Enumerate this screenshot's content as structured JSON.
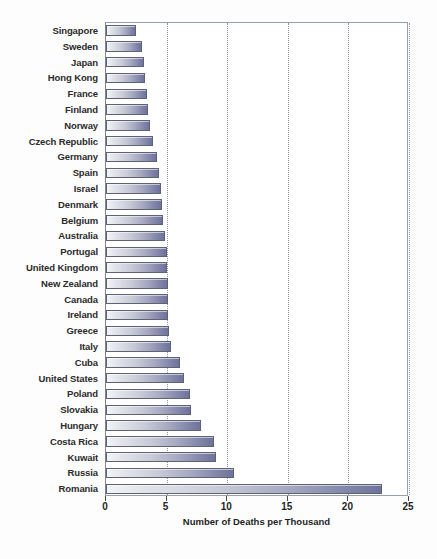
{
  "chart_data": {
    "type": "bar",
    "orientation": "horizontal",
    "title": "",
    "subtitle": "",
    "xlabel": "Number of Deaths per Thousand",
    "ylabel": "",
    "xlim": [
      0,
      25
    ],
    "xticks": [
      0,
      5,
      10,
      15,
      20,
      25
    ],
    "xtick_labels": [
      "0",
      "5",
      "10",
      "15",
      "20",
      "25"
    ],
    "grid": "vertical-dotted",
    "legend": "none",
    "series_name": "Number of Deaths per Thousand",
    "categories": [
      "Singapore",
      "Sweden",
      "Japan",
      "Hong Kong",
      "France",
      "Finland",
      "Norway",
      "Czech Republic",
      "Germany",
      "Spain",
      "Israel",
      "Denmark",
      "Belgium",
      "Australia",
      "Portugal",
      "United Kingdom",
      "New Zealand",
      "Canada",
      "Ireland",
      "Greece",
      "Italy",
      "Cuba",
      "United States",
      "Poland",
      "Slovakia",
      "Hungary",
      "Costa Rica",
      "Kuwait",
      "Russia",
      "Romania"
    ],
    "values": [
      2.5,
      3.0,
      3.1,
      3.2,
      3.4,
      3.5,
      3.6,
      3.9,
      4.2,
      4.4,
      4.5,
      4.6,
      4.7,
      4.9,
      5.0,
      5.0,
      5.1,
      5.1,
      5.1,
      5.2,
      5.4,
      6.1,
      6.4,
      6.9,
      7.0,
      7.8,
      8.9,
      9.1,
      10.6,
      22.8
    ],
    "colors": {
      "bar_gradient_start": "#f3f4f6",
      "bar_gradient_end": "#6f739c",
      "bar_border": "#5d6275",
      "gridline": "#8d93a0",
      "frame": "#9aa0a8",
      "plot_background": "#ffffff",
      "page_background": "#fdfdfd",
      "label_text": "#2b2b2b",
      "axis_text": "#1f1f1f"
    }
  }
}
